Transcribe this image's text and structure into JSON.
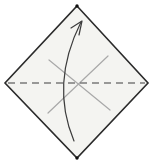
{
  "diagram": {
    "type": "origami-step",
    "canvas": {
      "width": 152,
      "height": 164,
      "background": "#ffffff"
    },
    "paper": {
      "points": "77,6 148,83 77,158 5,83",
      "fill": "#f4f4f1",
      "stroke": "#2b2b2b",
      "stroke_width": 1.6
    },
    "corner_dots": {
      "color": "#111111",
      "radius": 1.7,
      "points": [
        {
          "x": 77,
          "y": 6
        },
        {
          "x": 77,
          "y": 158
        }
      ]
    },
    "fold_line": {
      "x1": 8,
      "y1": 83,
      "x2": 145,
      "y2": 83,
      "stroke": "#7a7a7a",
      "stroke_width": 1.5,
      "dash": "7 5"
    },
    "creases": {
      "stroke": "#a9a9a9",
      "stroke_width": 1.2,
      "lines": [
        {
          "x1": 49,
          "y1": 60,
          "x2": 110,
          "y2": 110
        },
        {
          "x1": 48,
          "y1": 113,
          "x2": 108,
          "y2": 56
        }
      ]
    },
    "arrow": {
      "stroke": "#3c3c3c",
      "stroke_width": 1.2,
      "shaft_path": "M 74 141 Q 50 84 81 22",
      "head_path": "M 71 28 L 82 21 L 79 35"
    }
  }
}
